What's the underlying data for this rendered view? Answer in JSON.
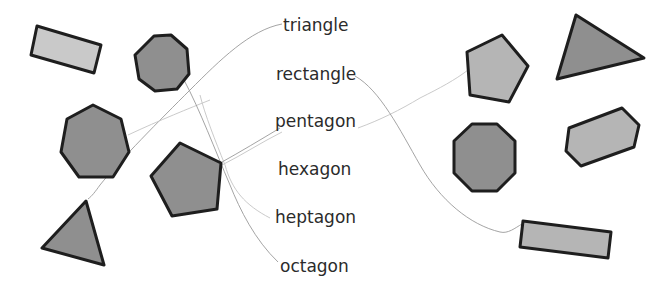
{
  "worksheet": {
    "labels": [
      "triangle",
      "rectangle",
      "pentagon",
      "hexagon",
      "heptagon",
      "octagon"
    ],
    "left_shapes": [
      {
        "kind": "rectangle",
        "shade": "light"
      },
      {
        "kind": "octagon",
        "shade": "dark"
      },
      {
        "kind": "heptagon",
        "shade": "dark"
      },
      {
        "kind": "pentagon",
        "shade": "dark"
      },
      {
        "kind": "triangle",
        "shade": "dark"
      }
    ],
    "right_shapes": [
      {
        "kind": "pentagon",
        "shade": "light"
      },
      {
        "kind": "triangle",
        "shade": "dark"
      },
      {
        "kind": "octagon",
        "shade": "dark"
      },
      {
        "kind": "hexagon",
        "shade": "light"
      },
      {
        "kind": "rectangle",
        "shade": "light"
      }
    ],
    "colors": {
      "dark_fill": "#8f8f8f",
      "light_fill": "#b5b5b5",
      "outline": "#1e1e1e",
      "connector": "#9a9a9a"
    }
  }
}
